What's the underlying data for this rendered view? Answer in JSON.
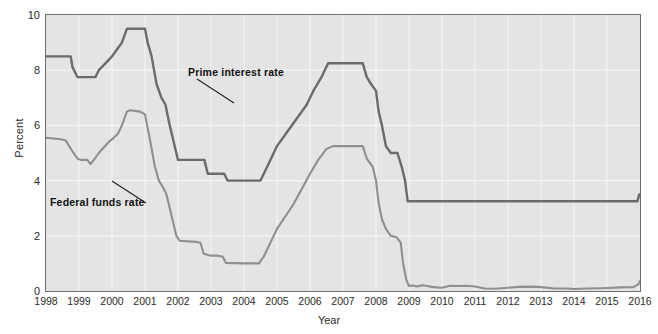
{
  "chart_data": {
    "type": "line",
    "title": "",
    "xlabel": "Year",
    "ylabel": "Percent",
    "xlim": [
      1998,
      2016
    ],
    "ylim": [
      0,
      10
    ],
    "yticks": [
      0,
      2,
      4,
      6,
      8,
      10
    ],
    "xticks": [
      1998,
      1999,
      2000,
      2001,
      2002,
      2003,
      2004,
      2005,
      2006,
      2007,
      2008,
      2009,
      2010,
      2011,
      2012,
      2013,
      2014,
      2015,
      2016
    ],
    "grid": true,
    "legend_position": "inline-annotations",
    "plot_background": "#e4e4e4",
    "gridline_color": "#f4f4f4",
    "series": [
      {
        "name": "Prime interest rate",
        "color": "#6b6b6b",
        "annotation": "Prime interest rate",
        "points": [
          [
            1998.0,
            8.5
          ],
          [
            1998.75,
            8.5
          ],
          [
            1998.8,
            8.12
          ],
          [
            1998.95,
            7.75
          ],
          [
            1999.0,
            7.75
          ],
          [
            1999.5,
            7.75
          ],
          [
            1999.6,
            8.0
          ],
          [
            1999.8,
            8.25
          ],
          [
            2000.0,
            8.5
          ],
          [
            2000.15,
            8.75
          ],
          [
            2000.3,
            9.0
          ],
          [
            2000.45,
            9.5
          ],
          [
            2000.55,
            9.5
          ],
          [
            2001.0,
            9.5
          ],
          [
            2001.08,
            9.0
          ],
          [
            2001.2,
            8.5
          ],
          [
            2001.35,
            7.5
          ],
          [
            2001.5,
            7.0
          ],
          [
            2001.62,
            6.75
          ],
          [
            2001.75,
            6.0
          ],
          [
            2001.85,
            5.5
          ],
          [
            2001.95,
            5.0
          ],
          [
            2002.0,
            4.75
          ],
          [
            2002.8,
            4.75
          ],
          [
            2002.9,
            4.25
          ],
          [
            2003.0,
            4.25
          ],
          [
            2003.4,
            4.25
          ],
          [
            2003.5,
            4.0
          ],
          [
            2004.0,
            4.0
          ],
          [
            2004.5,
            4.0
          ],
          [
            2004.6,
            4.25
          ],
          [
            2004.8,
            4.75
          ],
          [
            2005.0,
            5.25
          ],
          [
            2005.3,
            5.75
          ],
          [
            2005.6,
            6.25
          ],
          [
            2005.9,
            6.75
          ],
          [
            2006.1,
            7.25
          ],
          [
            2006.35,
            7.75
          ],
          [
            2006.55,
            8.25
          ],
          [
            2006.7,
            8.25
          ],
          [
            2007.0,
            8.25
          ],
          [
            2007.6,
            8.25
          ],
          [
            2007.72,
            7.75
          ],
          [
            2007.85,
            7.5
          ],
          [
            2008.0,
            7.25
          ],
          [
            2008.08,
            6.5
          ],
          [
            2008.18,
            6.0
          ],
          [
            2008.3,
            5.25
          ],
          [
            2008.45,
            5.0
          ],
          [
            2008.65,
            5.0
          ],
          [
            2008.78,
            4.5
          ],
          [
            2008.88,
            4.0
          ],
          [
            2008.96,
            3.25
          ],
          [
            2009.0,
            3.25
          ],
          [
            2010.0,
            3.25
          ],
          [
            2011.0,
            3.25
          ],
          [
            2012.0,
            3.25
          ],
          [
            2013.0,
            3.25
          ],
          [
            2014.0,
            3.25
          ],
          [
            2015.0,
            3.25
          ],
          [
            2015.92,
            3.25
          ],
          [
            2015.98,
            3.5
          ],
          [
            2016.0,
            3.5
          ]
        ]
      },
      {
        "name": "Federal funds rate",
        "color": "#8f8f8f",
        "annotation": "Federal funds rate",
        "points": [
          [
            1998.0,
            5.55
          ],
          [
            1998.45,
            5.5
          ],
          [
            1998.6,
            5.45
          ],
          [
            1998.78,
            5.1
          ],
          [
            1998.95,
            4.8
          ],
          [
            1999.05,
            4.75
          ],
          [
            1999.25,
            4.75
          ],
          [
            1999.35,
            4.6
          ],
          [
            1999.45,
            4.75
          ],
          [
            1999.6,
            5.0
          ],
          [
            1999.75,
            5.2
          ],
          [
            1999.9,
            5.4
          ],
          [
            2000.05,
            5.55
          ],
          [
            2000.18,
            5.7
          ],
          [
            2000.3,
            6.0
          ],
          [
            2000.45,
            6.5
          ],
          [
            2000.55,
            6.55
          ],
          [
            2000.85,
            6.5
          ],
          [
            2001.0,
            6.4
          ],
          [
            2001.08,
            5.9
          ],
          [
            2001.18,
            5.3
          ],
          [
            2001.3,
            4.5
          ],
          [
            2001.42,
            4.0
          ],
          [
            2001.55,
            3.75
          ],
          [
            2001.65,
            3.5
          ],
          [
            2001.75,
            3.0
          ],
          [
            2001.85,
            2.5
          ],
          [
            2001.95,
            2.0
          ],
          [
            2002.05,
            1.82
          ],
          [
            2002.55,
            1.78
          ],
          [
            2002.68,
            1.75
          ],
          [
            2002.78,
            1.35
          ],
          [
            2003.0,
            1.28
          ],
          [
            2003.2,
            1.28
          ],
          [
            2003.35,
            1.25
          ],
          [
            2003.45,
            1.02
          ],
          [
            2003.7,
            1.01
          ],
          [
            2004.0,
            1.0
          ],
          [
            2004.45,
            1.0
          ],
          [
            2004.6,
            1.25
          ],
          [
            2004.8,
            1.75
          ],
          [
            2005.0,
            2.25
          ],
          [
            2005.25,
            2.7
          ],
          [
            2005.5,
            3.15
          ],
          [
            2005.75,
            3.7
          ],
          [
            2006.0,
            4.25
          ],
          [
            2006.25,
            4.75
          ],
          [
            2006.5,
            5.15
          ],
          [
            2006.7,
            5.25
          ],
          [
            2007.0,
            5.25
          ],
          [
            2007.6,
            5.25
          ],
          [
            2007.72,
            4.8
          ],
          [
            2007.9,
            4.5
          ],
          [
            2008.0,
            4.0
          ],
          [
            2008.08,
            3.2
          ],
          [
            2008.18,
            2.6
          ],
          [
            2008.3,
            2.25
          ],
          [
            2008.45,
            2.0
          ],
          [
            2008.62,
            1.95
          ],
          [
            2008.75,
            1.75
          ],
          [
            2008.82,
            1.0
          ],
          [
            2008.92,
            0.4
          ],
          [
            2009.0,
            0.18
          ],
          [
            2009.12,
            0.2
          ],
          [
            2009.25,
            0.16
          ],
          [
            2009.4,
            0.21
          ],
          [
            2009.55,
            0.18
          ],
          [
            2009.7,
            0.15
          ],
          [
            2009.85,
            0.13
          ],
          [
            2010.0,
            0.12
          ],
          [
            2010.25,
            0.19
          ],
          [
            2010.5,
            0.18
          ],
          [
            2010.75,
            0.19
          ],
          [
            2011.0,
            0.16
          ],
          [
            2011.3,
            0.09
          ],
          [
            2011.6,
            0.08
          ],
          [
            2012.0,
            0.12
          ],
          [
            2012.35,
            0.15
          ],
          [
            2012.7,
            0.16
          ],
          [
            2013.0,
            0.14
          ],
          [
            2013.4,
            0.09
          ],
          [
            2013.8,
            0.09
          ],
          [
            2014.0,
            0.07
          ],
          [
            2014.4,
            0.09
          ],
          [
            2014.8,
            0.1
          ],
          [
            2015.0,
            0.11
          ],
          [
            2015.4,
            0.13
          ],
          [
            2015.8,
            0.14
          ],
          [
            2015.95,
            0.24
          ],
          [
            2016.0,
            0.36
          ]
        ]
      }
    ],
    "annotations": [
      {
        "text": "Prime interest rate",
        "leader_line": true
      },
      {
        "text": "Federal funds rate",
        "leader_line": true
      }
    ]
  },
  "axes": {
    "ylabel": "Percent",
    "xlabel": "Year",
    "ytick_labels": [
      "10",
      "8",
      "6",
      "4",
      "2",
      "0"
    ],
    "xtick_labels": [
      "1998",
      "1999",
      "2000",
      "2001",
      "2002",
      "2003",
      "2004",
      "2005",
      "2006",
      "2007",
      "2008",
      "2009",
      "2010",
      "2011",
      "2012",
      "2013",
      "2014",
      "2015",
      "2016"
    ]
  }
}
